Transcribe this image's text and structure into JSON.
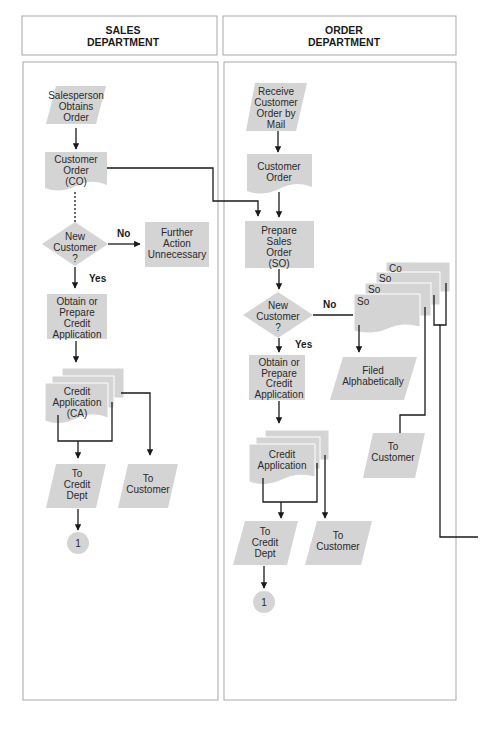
{
  "headers": {
    "sales": [
      "SALES",
      "DEPARTMENT"
    ],
    "order": [
      "ORDER",
      "DEPARTMENT"
    ]
  },
  "sales": {
    "salesperson_obtains_order": [
      "Salesperson",
      "Obtains",
      "Order"
    ],
    "customer_order_co": [
      "Customer",
      "Order",
      "(CO)"
    ],
    "new_customer": [
      "New",
      "Customer",
      "?"
    ],
    "no_label": "No",
    "yes_label": "Yes",
    "further_action": [
      "Further",
      "Action",
      "Unnecessary"
    ],
    "obtain_credit_app": [
      "Obtain or",
      "Prepare",
      "Credit",
      "Application"
    ],
    "credit_application_ca": [
      "Credit",
      "Application",
      "(CA)"
    ],
    "to_credit_dept": [
      "To",
      "Credit",
      "Dept"
    ],
    "to_customer": [
      "To",
      "Customer"
    ],
    "connector": "1"
  },
  "order": {
    "receive_order_mail": [
      "Receive",
      "Customer",
      "Order by",
      "Mail"
    ],
    "customer_order": [
      "Customer",
      "Order"
    ],
    "prepare_sales_order": [
      "Prepare",
      "Sales",
      "Order",
      "(SO)"
    ],
    "new_customer": [
      "New",
      "Customer",
      "?"
    ],
    "no_label": "No",
    "yes_label": "Yes",
    "stack_labels": [
      "Co",
      "So",
      "So",
      "So"
    ],
    "filed_alphabetically": [
      "Filed",
      "Alphabetically"
    ],
    "to_customer_right": [
      "To",
      "Customer"
    ],
    "obtain_credit_app": [
      "Obtain or",
      "Prepare",
      "Credit",
      "Application"
    ],
    "credit_application": [
      "Credit",
      "Application"
    ],
    "to_credit_dept": [
      "To",
      "Credit",
      "Dept"
    ],
    "to_customer": [
      "To",
      "Customer"
    ],
    "connector": "1"
  },
  "colors": {
    "shape_fill": "#d4d4d4",
    "line": "#1a1a1a",
    "frame": "#a8a8a8"
  }
}
